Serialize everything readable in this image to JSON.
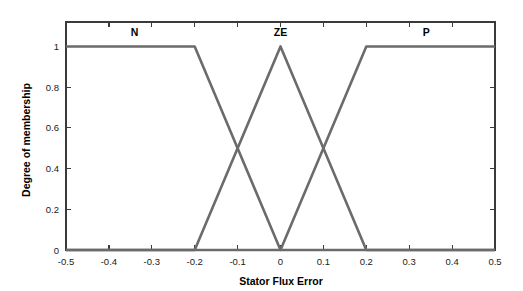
{
  "chart_data": {
    "type": "line",
    "title": "",
    "xlabel": "Stator Flux Error",
    "ylabel": "Degree of membership",
    "xlim": [
      -0.5,
      0.5
    ],
    "ylim": [
      0,
      1.12
    ],
    "grid": false,
    "legend_position": "inside-top",
    "xticks": [
      -0.5,
      -0.4,
      -0.3,
      -0.2,
      -0.1,
      0,
      0.1,
      0.2,
      0.3,
      0.4,
      0.5
    ],
    "xticklabels": [
      "-0.5",
      "-0.4",
      "-0.3",
      "-0.2",
      "-0.1",
      "0",
      "0.1",
      "0.2",
      "0.3",
      "0.4",
      "0.5"
    ],
    "yticks": [
      0,
      0.2,
      0.4,
      0.6,
      0.8,
      1
    ],
    "yticklabels": [
      "0",
      "0.2",
      "0.4",
      "0.6",
      "0.8",
      "1"
    ],
    "line_color": "#6b6b6b",
    "axis_color": "#3a3a3a",
    "background": "#ffffff",
    "series": [
      {
        "name": "N",
        "label_x": -0.34,
        "label_y": 1.07,
        "x": [
          -0.5,
          -0.2,
          0,
          0.5
        ],
        "values": [
          1,
          1,
          0,
          0
        ]
      },
      {
        "name": "ZE",
        "label_x": 0.0,
        "label_y": 1.07,
        "x": [
          -0.5,
          -0.2,
          0,
          0.2,
          0.5
        ],
        "values": [
          0,
          0,
          1,
          0,
          0
        ]
      },
      {
        "name": "P",
        "label_x": 0.34,
        "label_y": 1.07,
        "x": [
          -0.5,
          0,
          0.2,
          0.5
        ],
        "values": [
          0,
          0,
          1,
          1
        ]
      }
    ],
    "annotations": []
  }
}
